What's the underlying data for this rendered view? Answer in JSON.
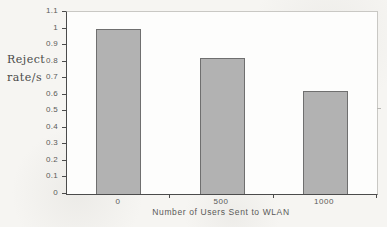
{
  "figure": {
    "page_background": "#f6f5f2",
    "plot_background": "#fdfdfc"
  },
  "chart_data": {
    "type": "bar",
    "categories": [
      "0",
      "500",
      "1000"
    ],
    "values": [
      1.0,
      0.82,
      0.62
    ],
    "title": "",
    "xlabel": "Number of Users Sent to WLAN",
    "ylabel": "Reject rate/s",
    "ylabel_lines": [
      "Reject",
      "rate/s"
    ],
    "ylim": [
      0,
      1.1
    ],
    "yticks": [
      0,
      0.1,
      0.2,
      0.3,
      0.4,
      0.5,
      0.6,
      0.7,
      0.8,
      0.9,
      1,
      1.1
    ],
    "ytick_labels": [
      "0",
      "0.1",
      "0.2",
      "0.3",
      "0.4",
      "0.5",
      "0.6",
      "0.7",
      "0.8",
      "0.9",
      "1",
      "1.1"
    ],
    "grid": false,
    "legend": "none",
    "bar_fill": "#b2b2b2",
    "bar_border": "#6f6f6f",
    "axis_color": "#4b4b4b",
    "frame_color": "#c9c8c4"
  }
}
